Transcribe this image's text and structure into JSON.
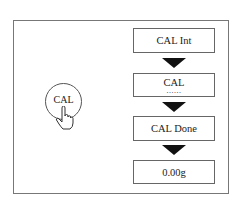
{
  "diagram": {
    "button": {
      "label": "CAL",
      "icon": "pointing-hand-icon"
    },
    "steps": [
      {
        "label": "CAL Int"
      },
      {
        "label": "CAL",
        "sub": "......"
      },
      {
        "label": "CAL Done"
      },
      {
        "label": "0.00g"
      }
    ],
    "arrow_icon": "down-triangle-icon"
  }
}
